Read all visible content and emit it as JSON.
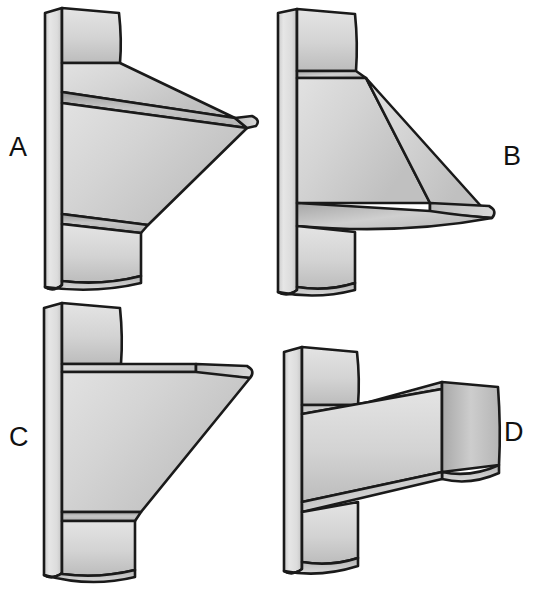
{
  "figure": {
    "kind": "spatial-reasoning-figure",
    "background_color": "#ffffff",
    "outline_color": "#1a1a1a",
    "fill_light": "#e8e8e8",
    "fill_mid": "#d2d2d2",
    "fill_dark": "#a9a9a9",
    "panels": [
      {
        "id": "A",
        "label": "A",
        "label_position": "left",
        "description": "Bracket with vertical back plate and a wedge that tapers to a single point at the right."
      },
      {
        "id": "B",
        "label": "B",
        "label_position": "right",
        "description": "Bracket with vertical back plate and a triangular gusset sloping down to the right, with a thin horizontal ledge at the bottom."
      },
      {
        "id": "C",
        "label": "C",
        "label_position": "left",
        "description": "Bracket with vertical back plate, a flat top shelf and a diagonal gusset sloping down to the left."
      },
      {
        "id": "D",
        "label": "D",
        "label_position": "right",
        "description": "Bracket with vertical back plate and a rectangular horizontal arm projecting to the right."
      }
    ]
  }
}
